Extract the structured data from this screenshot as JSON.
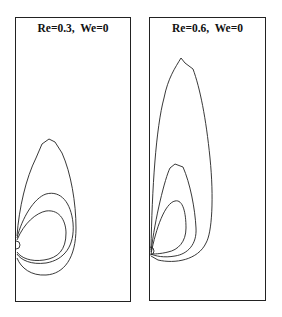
{
  "figure": {
    "panels": [
      {
        "title": "Re=0.3,  We=0",
        "contour_count": 3
      },
      {
        "title": "Re=0.6,  We=0",
        "contour_count": 3
      }
    ],
    "line_color": "#222222",
    "background": "#ffffff"
  }
}
